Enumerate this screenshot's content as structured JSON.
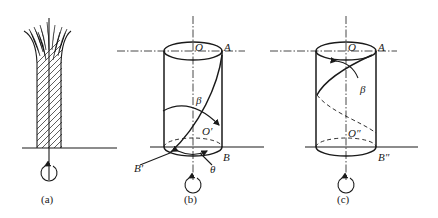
{
  "panels": [
    {
      "id": "a",
      "caption": "(a)",
      "labels": {}
    },
    {
      "id": "b",
      "caption": "(b)",
      "labels": {
        "center_top": "O",
        "top_point": "A",
        "angle_beta": "β",
        "center_bottom": "O′",
        "bottom_point": "B",
        "bottom_point_shifted": "B′",
        "angle_theta": "θ"
      }
    },
    {
      "id": "c",
      "caption": "(c)",
      "labels": {
        "center_top": "O",
        "top_point": "A",
        "angle_beta": "β",
        "center_bottom": "O″",
        "bottom_point": "B″"
      }
    }
  ]
}
